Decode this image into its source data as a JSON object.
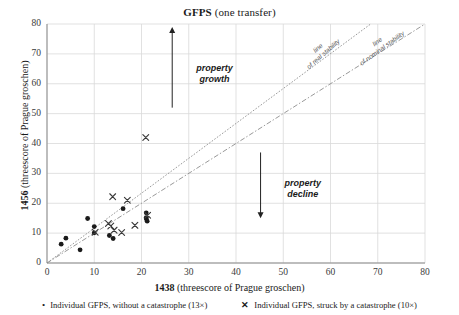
{
  "chart_data": {
    "type": "scatter",
    "title": "GFPS (one transfer)",
    "title_bold_part": "GFPS",
    "title_rest": " (one transfer)",
    "xlabel": "1438 (threescore of Prague groschen)",
    "xlabel_bold": "1438",
    "xlabel_rest": " (threescore of Prague groschen)",
    "ylabel": "1456 (threescore of Prague groschen)",
    "ylabel_bold": "1456",
    "ylabel_rest": " (threescore of Prague groschen)",
    "xlim": [
      0,
      80
    ],
    "ylim": [
      0,
      80
    ],
    "xticks": [
      0,
      10,
      20,
      30,
      40,
      50,
      60,
      70,
      80
    ],
    "yticks": [
      0,
      10,
      20,
      30,
      40,
      50,
      60,
      70,
      80
    ],
    "grid": true,
    "legend_position": "bottom",
    "series": [
      {
        "name": "Individual GFPS, without a catastrophe (13×)",
        "marker": "dot",
        "count": 13,
        "points": [
          [
            3.0,
            6.3
          ],
          [
            4.0,
            8.3
          ],
          [
            7.0,
            4.4
          ],
          [
            8.6,
            14.9
          ],
          [
            10.0,
            12.2
          ],
          [
            10.0,
            10.1
          ],
          [
            13.2,
            9.2
          ],
          [
            14.0,
            8.2
          ],
          [
            16.1,
            18.2
          ],
          [
            21.0,
            16.8
          ],
          [
            21.0,
            15.2
          ],
          [
            21.0,
            14.8
          ],
          [
            21.2,
            14.0
          ]
        ]
      },
      {
        "name": "Individual GFPS, struck by a catastrophe (10×)",
        "marker": "cross",
        "count": 10,
        "points": [
          [
            13.9,
            22.2
          ],
          [
            17.0,
            21.0
          ],
          [
            13.0,
            13.2
          ],
          [
            14.2,
            11.0
          ],
          [
            15.8,
            10.2
          ],
          [
            18.6,
            12.6
          ],
          [
            20.9,
            42.0
          ],
          [
            10.2,
            10.3
          ],
          [
            13.5,
            12.4
          ],
          [
            21.3,
            16.0
          ]
        ]
      }
    ],
    "reference_lines": [
      {
        "name": "line of real stability",
        "label_line1": "line",
        "label_line2": "of real stability",
        "from": [
          0,
          0
        ],
        "to": [
          68.5,
          80
        ],
        "style": "dotted"
      },
      {
        "name": "line of nominal stability",
        "label_line1": "line",
        "label_line2": "of nominal stability",
        "from": [
          0,
          0
        ],
        "to": [
          80,
          80
        ],
        "style": "dash-dot"
      }
    ],
    "annotations": [
      {
        "name": "property-growth",
        "label_line1": "property",
        "label_line2": "growth",
        "direction": "up",
        "x": 26.5,
        "y_from": 52,
        "y_to": 78
      },
      {
        "name": "property-decline",
        "label_line1": "property",
        "label_line2": "decline",
        "direction": "down",
        "x": 45.2,
        "y_from": 37,
        "y_to": 16
      }
    ]
  },
  "legend": {
    "items": [
      {
        "marker": "•",
        "label": "Individual GFPS, without a catastrophe (13×)"
      },
      {
        "marker": "✕",
        "label": "Individual GFPS, struck by a catastrophe (10×)"
      }
    ]
  }
}
